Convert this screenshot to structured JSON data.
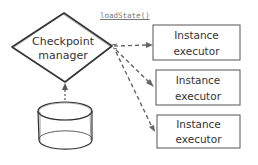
{
  "diagram": {
    "checkpoint_manager": {
      "line1": "Checkpoint",
      "line2": "manager"
    },
    "call_label": "loadState()",
    "executors": [
      {
        "line1": "Instance",
        "line2": "executor"
      },
      {
        "line1": "Instance",
        "line2": "executor"
      },
      {
        "line1": "Instance",
        "line2": "executor"
      }
    ],
    "storage": {
      "shape": "cylinder"
    },
    "colors": {
      "stroke": "#333333",
      "dashed_arrow": "#666666",
      "background": "#ffffff"
    }
  }
}
